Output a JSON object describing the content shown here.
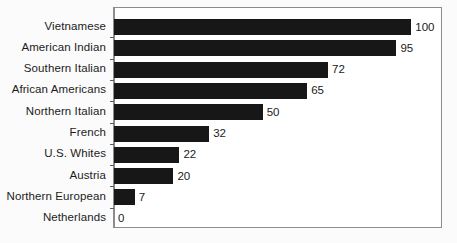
{
  "chart_data": {
    "type": "bar",
    "orientation": "horizontal",
    "title": "",
    "subtitle": "",
    "xlabel": "",
    "ylabel": "",
    "xlim": [
      0,
      110
    ],
    "grid": false,
    "legend": false,
    "show_value_labels": true,
    "categories": [
      "Vietnamese",
      "American Indian",
      "Southern Italian",
      "African Americans",
      "Northern Italian",
      "French",
      "U.S. Whites",
      "Austria",
      "Northern European",
      "Netherlands"
    ],
    "values": [
      100,
      95,
      72,
      65,
      50,
      32,
      22,
      20,
      7,
      0
    ],
    "value_labels": [
      "100",
      "95",
      "72",
      "65",
      "50",
      "32",
      "22",
      "20",
      "7",
      "0"
    ],
    "bar_color": "#171717",
    "plot_background": "#ffffff",
    "frame_color": "#8d8d90",
    "page_background": "#fbfbfc",
    "text_color": "#1b1b1b"
  }
}
